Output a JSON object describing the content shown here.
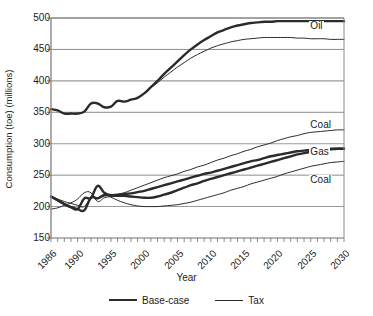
{
  "figure": {
    "cropped_title_remnant": "",
    "xlabel": "Year",
    "ylabel": "Consumption (toe) (millions)",
    "legend": [
      {
        "label": "Base-case",
        "style": "thick",
        "color": "#2b2b2b"
      },
      {
        "label": "Tax",
        "style": "thin",
        "color": "#2b2b2b"
      }
    ],
    "annotations": [
      {
        "text": "Oil",
        "x": 2026,
        "y": 487
      },
      {
        "text": "Coal",
        "x": 2026,
        "y": 329
      },
      {
        "text": "Gas",
        "x": 2026,
        "y": 287
      },
      {
        "text": "Coal",
        "x": 2026,
        "y": 242
      }
    ]
  },
  "chart_data": {
    "type": "line",
    "title": "",
    "xlabel": "Year",
    "ylabel": "Consumption (toe) (millions)",
    "xlim": [
      1986,
      2030
    ],
    "ylim": [
      150,
      500
    ],
    "yticks": [
      150,
      200,
      250,
      300,
      350,
      400,
      450,
      500
    ],
    "xticks": [
      1986,
      1990,
      1995,
      2000,
      2005,
      2010,
      2015,
      2020,
      2025,
      2030
    ],
    "xtick_rotation": -45,
    "minor_xticks": "annual",
    "grid": "horizontal",
    "legend_position": "bottom",
    "legend_entries": [
      "Base-case",
      "Tax"
    ],
    "line_color": "#2b2b2b",
    "x": [
      1986,
      1987,
      1988,
      1989,
      1990,
      1991,
      1992,
      1993,
      1994,
      1995,
      1996,
      1997,
      1998,
      1999,
      2000,
      2001,
      2002,
      2003,
      2004,
      2005,
      2006,
      2007,
      2008,
      2009,
      2010,
      2011,
      2012,
      2013,
      2014,
      2015,
      2016,
      2017,
      2018,
      2019,
      2020,
      2021,
      2022,
      2023,
      2024,
      2025,
      2026,
      2027,
      2028,
      2029,
      2030
    ],
    "series": [
      {
        "name": "Oil base-case",
        "label": "Oil",
        "style": "thick",
        "values": [
          355,
          353,
          348,
          348,
          348,
          351,
          364,
          364,
          358,
          359,
          368,
          367,
          370,
          373,
          380,
          390,
          400,
          411,
          421,
          431,
          441,
          450,
          458,
          465,
          471,
          477,
          481,
          485,
          488,
          490,
          492,
          493,
          494,
          494,
          495,
          495,
          495,
          495,
          495,
          495,
          495,
          495,
          495,
          495,
          495
        ]
      },
      {
        "name": "Oil tax",
        "label": "Oil",
        "style": "thin",
        "values": [
          355,
          353,
          348,
          348,
          348,
          351,
          364,
          364,
          358,
          359,
          368,
          367,
          370,
          373,
          380,
          389,
          397,
          406,
          414,
          422,
          429,
          436,
          442,
          447,
          452,
          456,
          459,
          462,
          464,
          466,
          467,
          468,
          469,
          469,
          469,
          469,
          469,
          468,
          468,
          467,
          467,
          467,
          466,
          466,
          466
        ]
      },
      {
        "name": "Coal tax (upper)",
        "label": "Coal",
        "style": "thin",
        "values": [
          196,
          198,
          202,
          206,
          212,
          222,
          222,
          208,
          214,
          216,
          219,
          222,
          226,
          230,
          234,
          238,
          242,
          246,
          249,
          252,
          256,
          259,
          263,
          266,
          270,
          274,
          277,
          281,
          284,
          288,
          291,
          295,
          298,
          301,
          305,
          308,
          311,
          313,
          316,
          318,
          319,
          320,
          321,
          322,
          322
        ]
      },
      {
        "name": "Gas base-case",
        "label": "Gas",
        "style": "thick",
        "values": [
          216,
          210,
          204,
          199,
          196,
          194,
          214,
          213,
          218,
          218,
          219,
          220,
          221,
          223,
          225,
          228,
          231,
          234,
          237,
          240,
          243,
          246,
          249,
          252,
          254,
          257,
          260,
          263,
          266,
          269,
          272,
          274,
          277,
          280,
          282,
          284,
          286,
          288,
          289,
          290,
          291,
          291,
          292,
          292,
          292
        ]
      },
      {
        "name": "Gas base-case (lower branch)",
        "label": "Gas",
        "style": "thick",
        "values": [
          216,
          210,
          204,
          199,
          196,
          213,
          214,
          233,
          222,
          218,
          217,
          217,
          216,
          215,
          214,
          214,
          216,
          219,
          222,
          226,
          230,
          234,
          237,
          241,
          244,
          247,
          250,
          253,
          256,
          259,
          262,
          265,
          268,
          271,
          274,
          277,
          280,
          283,
          285,
          287,
          289,
          290,
          291,
          292,
          292
        ]
      },
      {
        "name": "Coal tax (lower)",
        "label": "Coal",
        "style": "thin",
        "values": [
          216,
          212,
          208,
          205,
          202,
          200,
          214,
          214,
          219,
          215,
          210,
          206,
          203,
          201,
          200,
          200,
          200,
          201,
          202,
          203,
          205,
          207,
          210,
          213,
          216,
          219,
          222,
          226,
          229,
          232,
          236,
          239,
          242,
          245,
          248,
          252,
          255,
          258,
          261,
          264,
          266,
          268,
          270,
          271,
          272
        ]
      }
    ]
  }
}
